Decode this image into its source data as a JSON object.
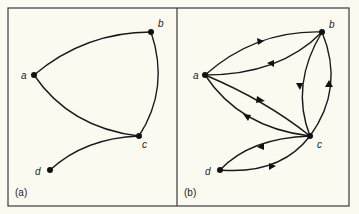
{
  "figure": {
    "panels": [
      {
        "caption": "(a)",
        "type": "undirected graph",
        "nodes": [
          {
            "id": "a",
            "label": "a"
          },
          {
            "id": "b",
            "label": "b"
          },
          {
            "id": "c",
            "label": "c"
          },
          {
            "id": "d",
            "label": "d"
          }
        ],
        "edges": [
          {
            "from": "a",
            "to": "b"
          },
          {
            "from": "a",
            "to": "c"
          },
          {
            "from": "b",
            "to": "c"
          },
          {
            "from": "c",
            "to": "d"
          }
        ]
      },
      {
        "caption": "(b)",
        "type": "directed graph",
        "nodes": [
          {
            "id": "a",
            "label": "a"
          },
          {
            "id": "b",
            "label": "b"
          },
          {
            "id": "c",
            "label": "c"
          },
          {
            "id": "d",
            "label": "d"
          }
        ],
        "edges": [
          {
            "from": "a",
            "to": "b"
          },
          {
            "from": "b",
            "to": "a"
          },
          {
            "from": "a",
            "to": "c"
          },
          {
            "from": "c",
            "to": "a"
          },
          {
            "from": "b",
            "to": "c"
          },
          {
            "from": "c",
            "to": "b"
          },
          {
            "from": "c",
            "to": "d"
          },
          {
            "from": "d",
            "to": "c"
          }
        ]
      }
    ]
  },
  "colors": {
    "background": "#fbfaf0",
    "ink": "#1a1a1a",
    "frame": "#3a3a3a"
  }
}
